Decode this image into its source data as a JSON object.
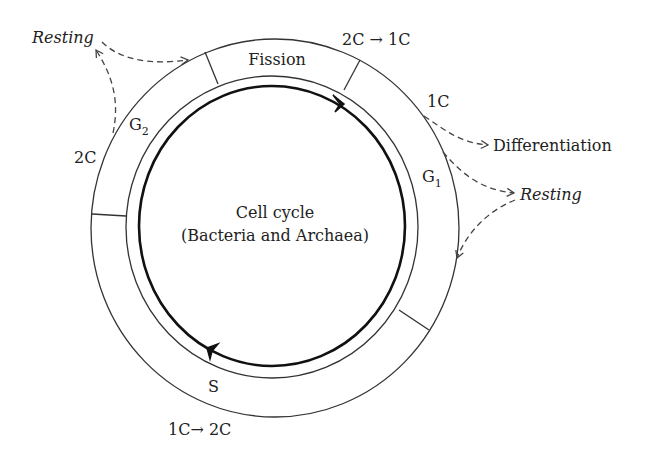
{
  "diagram": {
    "center_title": "Cell cycle",
    "center_subtitle": "(Bacteria and Archaea)",
    "phases": {
      "fission": "Fission",
      "g1": "G",
      "g1_sub": "1",
      "s": "S",
      "g2": "G",
      "g2_sub": "2"
    },
    "dna_content": {
      "fission_transition": "2C → 1C",
      "after_fission": "1C",
      "s_transition": "1C→ 2C",
      "g2_content": "2C"
    },
    "exits": {
      "resting_left": "Resting",
      "differentiation": "Differentiation",
      "resting_right": "Resting"
    },
    "cycle_direction": "clockwise",
    "colors": {
      "line": "#333333",
      "text": "#222222",
      "background": "#ffffff"
    }
  }
}
